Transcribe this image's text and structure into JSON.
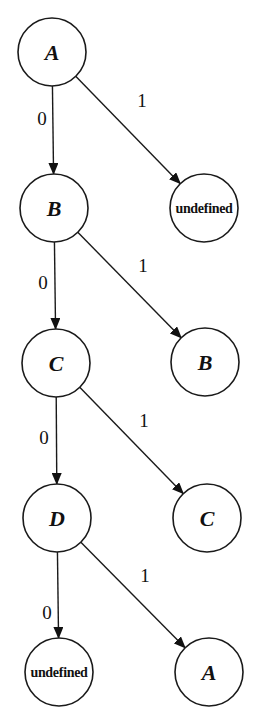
{
  "diagram": {
    "type": "state-transition-tree",
    "nodes": [
      {
        "id": "n1",
        "label": "A",
        "cx": 52,
        "cy": 52,
        "r": 34,
        "small": false
      },
      {
        "id": "n2",
        "label": "B",
        "cx": 54,
        "cy": 208,
        "r": 34,
        "small": false
      },
      {
        "id": "n3",
        "label": "undefined",
        "cx": 204,
        "cy": 208,
        "r": 34,
        "small": true
      },
      {
        "id": "n4",
        "label": "C",
        "cx": 56,
        "cy": 363,
        "r": 34,
        "small": false
      },
      {
        "id": "n5",
        "label": "B",
        "cx": 205,
        "cy": 362,
        "r": 34,
        "small": false
      },
      {
        "id": "n6",
        "label": "D",
        "cx": 57,
        "cy": 518,
        "r": 34,
        "small": false
      },
      {
        "id": "n7",
        "label": "C",
        "cx": 207,
        "cy": 518,
        "r": 34,
        "small": false
      },
      {
        "id": "n8",
        "label": "undefined",
        "cx": 59,
        "cy": 672,
        "r": 34,
        "small": true
      },
      {
        "id": "n9",
        "label": "A",
        "cx": 209,
        "cy": 672,
        "r": 34,
        "small": false
      }
    ],
    "edges": [
      {
        "from": "n1",
        "to": "n2",
        "label": "0",
        "lx": 42,
        "ly": 118
      },
      {
        "from": "n1",
        "to": "n3",
        "label": "1",
        "lx": 142,
        "ly": 100
      },
      {
        "from": "n2",
        "to": "n4",
        "label": "0",
        "lx": 43,
        "ly": 282
      },
      {
        "from": "n2",
        "to": "n5",
        "label": "1",
        "lx": 143,
        "ly": 265
      },
      {
        "from": "n4",
        "to": "n6",
        "label": "0",
        "lx": 44,
        "ly": 437
      },
      {
        "from": "n4",
        "to": "n7",
        "label": "1",
        "lx": 144,
        "ly": 420
      },
      {
        "from": "n6",
        "to": "n8",
        "label": "0",
        "lx": 47,
        "ly": 612
      },
      {
        "from": "n6",
        "to": "n9",
        "label": "1",
        "lx": 145,
        "ly": 575
      }
    ]
  }
}
